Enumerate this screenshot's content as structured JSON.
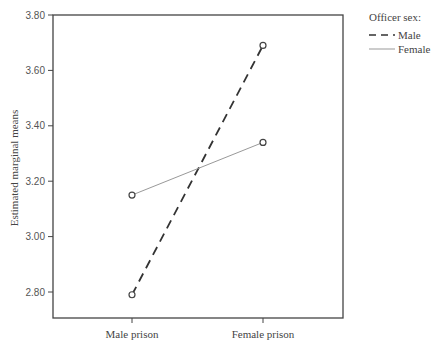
{
  "chart_data": {
    "type": "line",
    "title": "",
    "xlabel": "",
    "ylabel": "Estimated marginal means",
    "categories": [
      "Male prison",
      "Female prison"
    ],
    "series": [
      {
        "name": "Male",
        "values": [
          2.79,
          3.69
        ],
        "style": "dashed",
        "color": "#333333"
      },
      {
        "name": "Female",
        "values": [
          3.15,
          3.34
        ],
        "style": "solid",
        "color": "#999999"
      }
    ],
    "ylim": [
      2.7,
      3.8
    ],
    "yticks": [
      2.8,
      3.0,
      3.2,
      3.4,
      3.6,
      3.8
    ],
    "ytick_labels": [
      "2.80",
      "3.00",
      "3.20",
      "3.40",
      "3.60",
      "3.80"
    ],
    "grid": false,
    "legend": {
      "title": "Officer sex:",
      "position": "right-top",
      "entries": [
        "Male",
        "Female"
      ]
    },
    "marker": "open-circle"
  }
}
